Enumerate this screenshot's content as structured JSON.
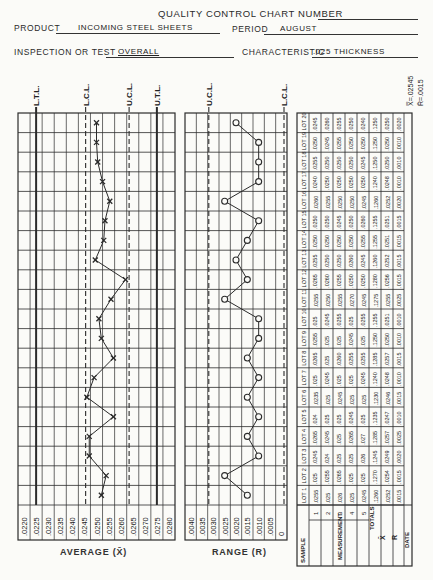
{
  "header": {
    "title": "QUALITY CONTROL CHART NUMBER",
    "product_label": "PRODUCT",
    "product_value": "INCOMING STEEL SHEETS",
    "period_label": "PERIOD",
    "period_value": "AUGUST",
    "inspection_label": "INSPECTION OR TEST",
    "inspection_value": "OVERALL",
    "characteristic_label": "CHARACTERISTIC",
    "characteristic_value": ".025 THICKNESS"
  },
  "grand_stats": {
    "xbarbar": "X̿=.02545",
    "rbar": "R̄=.0015"
  },
  "table": {
    "sample_label": "SAMPLE",
    "measurement_label": "MEASUREMENT",
    "totals_label": "TOTALS",
    "xbar_label": "X̄",
    "r_label": "R",
    "date_label": "DATE",
    "lot_prefix": "LOT"
  },
  "chart_data": [
    {
      "type": "line",
      "title": "AVERAGE (X̄)",
      "xlabel": "AVERAGE (X̄)",
      "ylabel": "Lot",
      "orientation": "vertical (lots run bottom to top)",
      "axis_ticks": [
        ".0220",
        ".0225",
        ".0230",
        ".0235",
        ".0240",
        ".0245",
        ".0250",
        ".0255",
        ".0260",
        ".0265",
        ".0270",
        ".0275",
        ".0280"
      ],
      "limit_lines": [
        {
          "name": "L.T.L.",
          "value": 0.0225,
          "style": "solid"
        },
        {
          "name": "L.C.L.",
          "value": 0.02455,
          "style": "dashed"
        },
        {
          "name": "U.C.L.",
          "value": 0.02635,
          "style": "dashed"
        },
        {
          "name": "U.T.L.",
          "value": 0.0275,
          "style": "solid"
        }
      ],
      "x": [
        1,
        2,
        3,
        4,
        5,
        6,
        7,
        8,
        9,
        10,
        11,
        12,
        13,
        14,
        15,
        16,
        17,
        18,
        19,
        20
      ],
      "values": [
        0.0252,
        0.0254,
        0.0247,
        0.0247,
        0.0257,
        0.0246,
        0.0249,
        0.0257,
        0.0252,
        0.0251,
        0.0256,
        0.0262,
        0.02495,
        0.0253,
        0.02535,
        0.02555,
        0.02525,
        0.02505,
        0.025,
        0.025
      ],
      "marker": "x",
      "ylim": [
        1,
        20
      ]
    },
    {
      "type": "line",
      "title": "RANGE (R)",
      "xlabel": "RANGE (R)",
      "ylabel": "Lot",
      "orientation": "vertical (lots run bottom to top)",
      "axis_ticks": [
        ".0040",
        ".0035",
        ".0030",
        ".0025",
        ".0020",
        ".0015",
        ".0010",
        ".0005",
        "0"
      ],
      "limit_lines": [
        {
          "name": "U.C.L.",
          "value": 0.0032,
          "style": "dashed"
        },
        {
          "name": "L.C.L.",
          "value": 0.0,
          "style": "dashed"
        }
      ],
      "x": [
        1,
        2,
        3,
        4,
        5,
        6,
        7,
        8,
        9,
        10,
        11,
        12,
        13,
        14,
        15,
        16,
        17,
        18,
        19,
        20
      ],
      "values": [
        0.0015,
        0.0025,
        0.001,
        0.0015,
        0.001,
        0.0015,
        0.001,
        0.0015,
        0.001,
        0.001,
        0.0025,
        0.0015,
        0.002,
        0.0015,
        0.001,
        0.0025,
        0.001,
        0.001,
        0.001,
        0.002
      ],
      "marker": "o",
      "ylim": [
        1,
        20
      ]
    },
    {
      "type": "table",
      "title": "Measurements by lot",
      "columns": [
        "LOT 1",
        "LOT 2",
        "LOT 3",
        "LOT 4",
        "LOT 5",
        "LOT 6",
        "LOT 7",
        "LOT 8",
        "LOT 9",
        "LOT 10",
        "LOT 11",
        "LOT 12",
        "LOT 13",
        "LOT 14",
        "LOT 15",
        "LOT 16",
        "LOT 17",
        "LOT 18",
        "LOT 19",
        "LOT 20"
      ],
      "rows": [
        {
          "label": "1",
          "values": [
            ".0255",
            ".025",
            ".0245",
            ".0265",
            ".024",
            ".0235",
            ".025",
            ".0265",
            ".0255",
            ".025",
            ".0255",
            ".0265",
            ".0255",
            ".0250",
            ".0250",
            ".0260",
            ".0240",
            ".0255",
            ".0250",
            ".0245"
          ]
        },
        {
          "label": "2",
          "values": [
            ".025",
            ".0255",
            ".024",
            ".0245",
            ".025",
            ".025",
            ".0245",
            ".025",
            ".025",
            ".0245",
            ".0250",
            ".0260",
            ".0250",
            ".0250",
            ".0250",
            ".0255",
            ".0250",
            ".0250",
            ".0245",
            ".0260"
          ]
        },
        {
          "label": "3",
          "values": [
            ".026",
            ".0265",
            ".025",
            ".025",
            ".025",
            ".0245",
            ".025",
            ".0260",
            ".025",
            ".0255",
            ".0255",
            ".0255",
            ".0250",
            ".0250",
            ".0245",
            ".0250",
            ".0250",
            ".0250",
            ".0255",
            ".0255"
          ]
        },
        {
          "label": "4",
          "values": [
            ".025",
            ".025",
            ".025",
            ".0265",
            ".0245",
            ".025",
            ".025",
            ".0255",
            ".0245",
            ".025",
            ".0270",
            ".0250",
            ".0260",
            ".0250",
            ".0250",
            ".0250",
            ".0250",
            ".0250",
            ".0250",
            ".0250"
          ]
        },
        {
          "label": "5",
          "values": [
            ".0245",
            ".025",
            ".026",
            ".027",
            ".025",
            ".025",
            ".0245",
            ".0255",
            ".025",
            ".0255",
            ".0245",
            ".0250",
            ".0245",
            ".0255",
            ".0260",
            ".0245",
            ".0250",
            ".0245",
            ".0250",
            ".0240"
          ]
        },
        {
          "label": "TOTALS",
          "values": [
            ".1260",
            ".1270",
            ".1245",
            ".1285",
            ".1235",
            ".1230",
            ".1240",
            ".1285",
            ".1250",
            ".1255",
            ".1275",
            ".1280",
            ".1260",
            ".1255",
            ".1255",
            ".1260",
            ".1240",
            ".1250",
            ".1250",
            ".1250"
          ]
        },
        {
          "label": "X̄",
          "values": [
            ".0252",
            ".0254",
            ".0249",
            ".0257",
            ".0247",
            ".0246",
            ".0248",
            ".0257",
            ".0250",
            ".0251",
            ".0255",
            ".0256",
            ".0252",
            ".0251",
            ".0251",
            ".0252",
            ".0248",
            ".0250",
            ".0250",
            ".0250"
          ]
        },
        {
          "label": "R",
          "values": [
            ".0015",
            ".0015",
            ".0020",
            ".0025",
            ".0010",
            ".0015",
            ".0010",
            ".0015",
            ".0010",
            ".0010",
            ".0025",
            ".0015",
            ".0015",
            ".0015",
            ".0015",
            ".0020",
            ".0010",
            ".0010",
            ".0010",
            ".0020"
          ]
        }
      ]
    }
  ]
}
